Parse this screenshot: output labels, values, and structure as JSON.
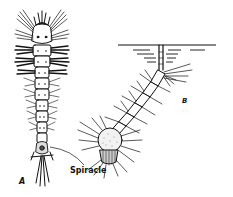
{
  "figure": {
    "type": "scientific-illustration",
    "panels": [
      {
        "id": "A",
        "label": "A",
        "description": "larva in dorsal view, vertical orientation"
      },
      {
        "id": "B",
        "label": "B",
        "description": "larva hanging from water surface by siphon"
      }
    ],
    "annotations": [
      {
        "text": "Spiracle",
        "target": "A"
      }
    ],
    "colors": {
      "ink": "#111111",
      "background": "#ffffff"
    }
  }
}
